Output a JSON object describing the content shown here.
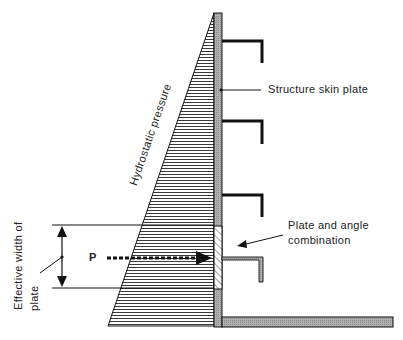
{
  "diagram": {
    "type": "structural-cross-section",
    "labels": {
      "skin_plate": "Structure  skin  plate",
      "hydrostatic": "Hydrostatic pressure",
      "plate_angle_line1": "Plate and angle",
      "plate_angle_line2": "combination",
      "effective_width_line1": "Effective width of",
      "effective_width_line2": "plate",
      "force": "P"
    },
    "colors": {
      "line": "#111111",
      "plate_fill": "#a8a8a8",
      "background": "#ffffff"
    }
  }
}
